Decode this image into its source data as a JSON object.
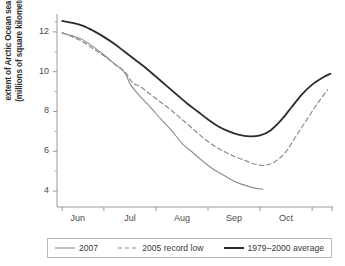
{
  "chart_data": {
    "type": "line",
    "title": "",
    "xlabel": "",
    "ylabel": "extent of Arctic Ocean sea ice (millions of square kilometers)",
    "ylabel_line1": "extent of Arctic Ocean sea ice",
    "ylabel_line2": "(millions of square kilometers)",
    "grid": false,
    "legend_position": "bottom",
    "xlim": [
      5.6,
      10.9
    ],
    "ylim": [
      3.2,
      12.9
    ],
    "y_ticks": [
      4,
      6,
      8,
      10,
      12
    ],
    "y_tick_labels": [
      "4",
      "6",
      "8",
      "10",
      "12"
    ],
    "y_minor_ticks": [
      5,
      7,
      9,
      11,
      12.5
    ],
    "x_tick_labels": [
      "Jun",
      "Jul",
      "Aug",
      "Sep",
      "Oct"
    ],
    "x_tick_positions": [
      6,
      7,
      8,
      9,
      10
    ],
    "x_axis_units": "month",
    "y_axis_units": "millions of square kilometers",
    "series": [
      {
        "name": "2007",
        "color": "#8c8c8c",
        "style": "solid",
        "width": 1.1,
        "x": [
          5.7,
          5.9,
          6.1,
          6.3,
          6.5,
          6.7,
          6.9,
          7.0,
          7.1,
          7.2,
          7.4,
          7.6,
          7.8,
          8.0,
          8.2,
          8.4,
          8.6,
          8.8,
          9.0,
          9.2,
          9.4,
          9.55
        ],
        "values": [
          11.95,
          11.8,
          11.6,
          11.25,
          10.85,
          10.4,
          9.95,
          9.4,
          9.05,
          8.75,
          8.2,
          7.6,
          7.05,
          6.4,
          5.95,
          5.5,
          5.1,
          4.8,
          4.5,
          4.3,
          4.15,
          4.1
        ]
      },
      {
        "name": "2005 record low",
        "color": "#8c8c8c",
        "style": "dashed",
        "width": 1.2,
        "x": [
          5.7,
          5.9,
          6.1,
          6.3,
          6.5,
          6.7,
          6.9,
          7.05,
          7.2,
          7.4,
          7.6,
          7.8,
          8.0,
          8.2,
          8.4,
          8.6,
          8.8,
          9.0,
          9.2,
          9.4,
          9.6,
          9.8,
          10.0,
          10.2,
          10.4,
          10.6,
          10.8
        ],
        "values": [
          11.95,
          11.75,
          11.5,
          11.15,
          10.8,
          10.4,
          10.0,
          9.45,
          9.25,
          8.85,
          8.45,
          8.05,
          7.6,
          7.15,
          6.7,
          6.3,
          6.0,
          5.75,
          5.55,
          5.35,
          5.3,
          5.5,
          6.0,
          6.8,
          7.6,
          8.4,
          9.1
        ]
      },
      {
        "name": "1979–2000 average",
        "color": "#2b2b2b",
        "style": "solid",
        "width": 1.8,
        "x": [
          5.7,
          5.9,
          6.1,
          6.3,
          6.5,
          6.7,
          6.9,
          7.1,
          7.3,
          7.5,
          7.7,
          7.9,
          8.1,
          8.3,
          8.5,
          8.7,
          8.9,
          9.1,
          9.3,
          9.5,
          9.7,
          9.9,
          10.1,
          10.3,
          10.5,
          10.7,
          10.85
        ],
        "values": [
          12.55,
          12.45,
          12.3,
          12.05,
          11.75,
          11.4,
          11.0,
          10.6,
          10.2,
          9.75,
          9.3,
          8.85,
          8.4,
          8.0,
          7.6,
          7.25,
          7.0,
          6.82,
          6.75,
          6.8,
          7.05,
          7.55,
          8.2,
          8.85,
          9.35,
          9.7,
          9.9
        ]
      }
    ]
  },
  "legend": {
    "items": [
      {
        "label": "2007",
        "style": "solid-thin",
        "color": "#8c8c8c"
      },
      {
        "label": "2005 record low",
        "style": "dashed",
        "color": "#8c8c8c"
      },
      {
        "label": "1979–2000 average",
        "style": "solid-thick",
        "color": "#2b2b2b"
      }
    ]
  },
  "axis_colors": {
    "axis_line": "#9a9a9a",
    "tick": "#9a9a9a",
    "text": "#3a3a3a"
  }
}
